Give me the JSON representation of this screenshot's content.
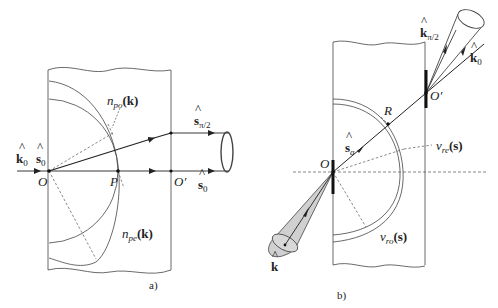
{
  "figure": {
    "panels": [
      {
        "id": "a",
        "caption": "a)",
        "points": {
          "O": "O",
          "P": "P",
          "O_prime": "O′"
        },
        "labels": {
          "k0_hat": "k",
          "k0_sub": "0",
          "s0_hat_left": "s",
          "s0_sub_left": "0",
          "n_po_n": "n",
          "n_po_sub": "po",
          "n_po_arg": "(k)",
          "n_pe_n": "n",
          "n_pe_sub": "pe",
          "n_pe_arg": "(k)",
          "s_pi2": "s",
          "s_pi2_sub": "π/2",
          "s0_right": "s",
          "s0_right_sub": "0"
        }
      },
      {
        "id": "b",
        "caption": "b)",
        "points": {
          "O": "O",
          "R": "R",
          "O_prime": "O′"
        },
        "labels": {
          "k_pi2": "k",
          "k_pi2_sub": "π/2",
          "k0": "k",
          "k0_sub": "0",
          "s_a": "s",
          "s_a_sub": "a",
          "v_re_v": "v",
          "v_re_sub": "re",
          "v_re_arg": "(s)",
          "v_ro_v": "v",
          "v_ro_sub": "ro",
          "v_ro_arg": "(s)",
          "k_hat": "k"
        }
      }
    ],
    "colors": {
      "line": "#333333",
      "dashed": "#555555",
      "cone_fill": "#d0d0d0"
    }
  }
}
